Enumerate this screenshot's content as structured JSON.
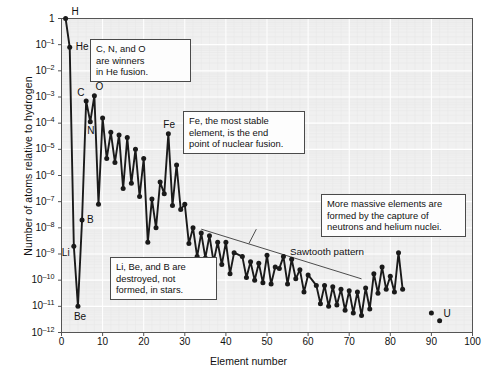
{
  "chart_data": {
    "type": "line",
    "title": "",
    "xlabel": "Element number",
    "ylabel": "Number of atoms relative to hydrogen",
    "xlim": [
      0,
      100
    ],
    "ylim_log10": [
      -12,
      0
    ],
    "grid": true,
    "legend": "none",
    "marker": "filled-circle",
    "xticks": [
      "0",
      "10",
      "20",
      "30",
      "40",
      "50",
      "60",
      "70",
      "80",
      "90",
      "100"
    ],
    "yticks": [
      "1",
      "10-1",
      "10-2",
      "10-3",
      "10-4",
      "10-5",
      "10-6",
      "10-7",
      "10-8",
      "10-9",
      "10-10",
      "10-11",
      "10-12"
    ],
    "ytick_exponents": [
      "",
      "-1",
      "-2",
      "-3",
      "-4",
      "-5",
      "-6",
      "-7",
      "-8",
      "-9",
      "-10",
      "-11",
      "-12"
    ],
    "series": [
      {
        "name": "Solar system abundance relative to hydrogen",
        "connected": true,
        "x": [
          1,
          2,
          3,
          4,
          5,
          6,
          7,
          8,
          9,
          10,
          11,
          12,
          13,
          14,
          15,
          16,
          17,
          18,
          19,
          20,
          21,
          22,
          23,
          24,
          25,
          26,
          27,
          28,
          29,
          30,
          31,
          32,
          33,
          34,
          35,
          36,
          37,
          38,
          39,
          40,
          41,
          42,
          44,
          45,
          46,
          47,
          48,
          49,
          50,
          51,
          52,
          53,
          54,
          55,
          56,
          57,
          58,
          59,
          60,
          62,
          63,
          64,
          65,
          66,
          67,
          68,
          69,
          70,
          71,
          72,
          73,
          74,
          75,
          76,
          77,
          78,
          79,
          80,
          81,
          82,
          83
        ],
        "log10_y": [
          0,
          -1.1,
          -8.7,
          -11.0,
          -7.7,
          -3.15,
          -3.95,
          -2.95,
          -7.1,
          -3.8,
          -5.35,
          -4.35,
          -5.5,
          -4.45,
          -6.5,
          -4.55,
          -6.3,
          -5.0,
          -6.8,
          -5.35,
          -8.55,
          -6.9,
          -8.0,
          -6.25,
          -6.7,
          -4.4,
          -7.15,
          -5.6,
          -7.3,
          -7.1,
          -8.6,
          -8.0,
          -9.1,
          -8.2,
          -9.15,
          -8.3,
          -9.3,
          -8.55,
          -9.4,
          -8.55,
          -9.75,
          -8.95,
          -9.1,
          -9.9,
          -9.3,
          -10.0,
          -9.35,
          -10.1,
          -9.05,
          -10.15,
          -9.5,
          -9.55,
          -9.1,
          -10.15,
          -9.2,
          -9.95,
          -9.6,
          -10.45,
          -9.8,
          -10.2,
          -10.9,
          -10.2,
          -11.0,
          -10.25,
          -10.95,
          -10.35,
          -11.15,
          -10.4,
          -11.25,
          -10.45,
          -11.35,
          -10.3,
          -11.1,
          -9.75,
          -10.5,
          -9.5,
          -10.35,
          -9.85,
          -10.45,
          -8.95,
          -10.35
        ]
      },
      {
        "name": "Heavy radioactive elements",
        "connected": false,
        "x": [
          90,
          92
        ],
        "log10_y": [
          -11.25,
          -11.55
        ]
      }
    ],
    "point_labels": [
      {
        "element": "H",
        "x": 1,
        "log10_y": 0
      },
      {
        "element": "He",
        "x": 2,
        "log10_y": -1.1
      },
      {
        "element": "Li",
        "x": 3,
        "log10_y": -8.7
      },
      {
        "element": "Be",
        "x": 4,
        "log10_y": -11.0
      },
      {
        "element": "B",
        "x": 5,
        "log10_y": -7.7
      },
      {
        "element": "C",
        "x": 6,
        "log10_y": -3.15
      },
      {
        "element": "N",
        "x": 7,
        "log10_y": -3.95
      },
      {
        "element": "O",
        "x": 8,
        "log10_y": -2.95
      },
      {
        "element": "Fe",
        "x": 26,
        "log10_y": -4.4
      },
      {
        "element": "U",
        "x": 92,
        "log10_y": -11.55
      }
    ],
    "annotations": [
      {
        "id": "sawtooth",
        "text": "Sawtooth pattern"
      }
    ],
    "callouts": [
      {
        "id": "cno",
        "text": "C, N, and O\nare winners\nin He fusion."
      },
      {
        "id": "iron",
        "text": "Fe, the most stable\nelement, is the end\npoint of nuclear fusion."
      },
      {
        "id": "libeb",
        "text": "Li, Be, and B are\ndestroyed, not\nformed, in stars."
      },
      {
        "id": "capture",
        "text": "More massive elements are\nformed by the capture of\nneutrons and helium nuclei."
      }
    ],
    "colors": {
      "line": "#1a1a1a",
      "marker": "#1a1a1a",
      "plot_background": "#f0f0f0",
      "grid": "#ffffff",
      "axis": "#555555",
      "callout_border": "#4a4a4a",
      "callout_background": "#fdfdfd",
      "text": "#111111"
    }
  }
}
